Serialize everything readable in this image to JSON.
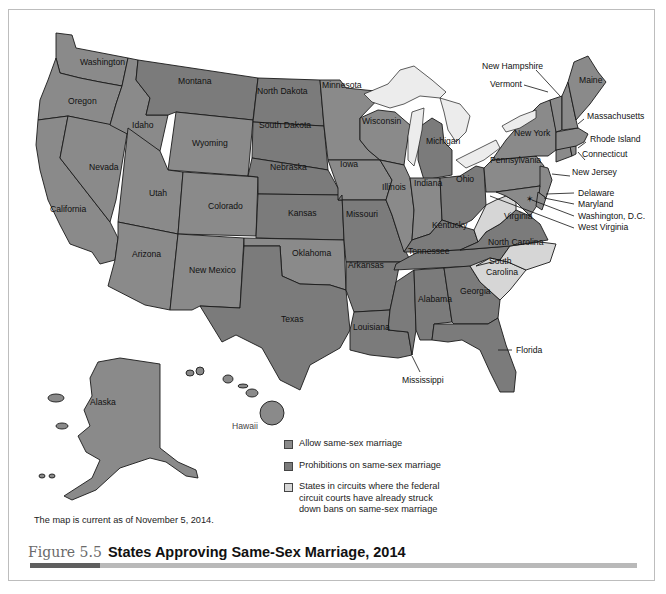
{
  "figure": {
    "number": "Figure 5.5",
    "title": "States Approving Same-Sex Marriage, 2014",
    "note": "The map is current as of November 5, 2014."
  },
  "colors": {
    "allow": "#8a8a8a",
    "prohibit": "#7b7b7b",
    "circuit": "#d6d6d6",
    "lake": "#ececec",
    "border": "#1a1a1a",
    "caption_accent": "#5f5f5f",
    "caption_bar": "#b9b9b9"
  },
  "legend": [
    {
      "key": "allow",
      "label": "Allow same-sex marriage"
    },
    {
      "key": "prohibit",
      "label": "Prohibitions on same-sex marriage"
    },
    {
      "key": "circuit",
      "label": "States in circuits where the federal circuit courts have already struck down bans on same-sex marriage"
    }
  ],
  "states": {
    "washington": "Washington",
    "oregon": "Oregon",
    "california": "California",
    "nevada": "Nevada",
    "idaho": "Idaho",
    "montana": "Montana",
    "wyoming": "Wyoming",
    "utah": "Utah",
    "arizona": "Arizona",
    "colorado": "Colorado",
    "new_mexico": "New Mexico",
    "north_dakota": "North Dakota",
    "south_dakota": "South Dakota",
    "nebraska": "Nebraska",
    "kansas": "Kansas",
    "oklahoma": "Oklahoma",
    "texas": "Texas",
    "minnesota": "Minnesota",
    "iowa": "Iowa",
    "missouri": "Missouri",
    "arkansas": "Arkansas",
    "louisiana": "Louisiana",
    "wisconsin": "Wisconsin",
    "illinois": "Illinois",
    "michigan": "Michigan",
    "indiana": "Indiana",
    "ohio": "Ohio",
    "kentucky": "Kentucky",
    "tennessee": "Tennessee",
    "mississippi": "Mississippi",
    "alabama": "Alabama",
    "georgia": "Georgia",
    "florida": "Florida",
    "south_carolina_1": "South",
    "south_carolina_2": "Carolina",
    "north_carolina": "North Carolina",
    "virginia": "Virginia",
    "west_virginia": "West Virginia",
    "pennsylvania": "Pennsylvania",
    "new_york": "New York",
    "new_jersey": "New Jersey",
    "delaware": "Delaware",
    "maryland": "Maryland",
    "dc": "Washington, D.C.",
    "connecticut": "Connecticut",
    "rhode_island": "Rhode Island",
    "massachusetts": "Massachusetts",
    "vermont": "Vermont",
    "new_hampshire": "New Hampshire",
    "maine": "Maine",
    "alaska": "Alaska",
    "hawaii": "Hawaii"
  }
}
